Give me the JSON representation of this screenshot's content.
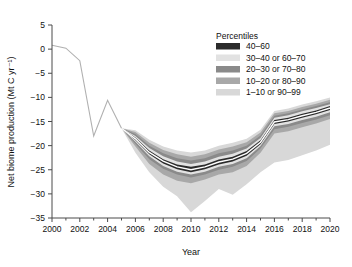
{
  "chart_data": {
    "type": "area",
    "title": "",
    "xlabel": "Year",
    "ylabel": "Net biome production (Mt C yr⁻¹)",
    "xlim": [
      2000,
      2020
    ],
    "ylim": [
      -35,
      5
    ],
    "xticks": [
      2000,
      2002,
      2004,
      2006,
      2008,
      2010,
      2012,
      2014,
      2016,
      2018,
      2020
    ],
    "xtick_labels": [
      "2000",
      "2002",
      "2004",
      "2006",
      "2008",
      "2010",
      "2012",
      "2014",
      "2016",
      "2018",
      "2020"
    ],
    "xminor_ticks": [
      2001,
      2003,
      2005,
      2007,
      2009,
      2011,
      2013,
      2015,
      2017,
      2019
    ],
    "yticks": [
      5,
      0,
      -5,
      -10,
      -15,
      -20,
      -25,
      -30,
      -35
    ],
    "ytick_labels": [
      "5",
      "0",
      "−5",
      "−10",
      "−15",
      "−20",
      "−25",
      "−30",
      "−35"
    ],
    "grid": false,
    "legend_position": "top-right",
    "legend_title": "Percentiles",
    "legend_entries": [
      {
        "label": "40–60",
        "color": "#2b2b2b"
      },
      {
        "label": "30–40 or 60–70",
        "color": "#e2e2e2"
      },
      {
        "label": "20–30 or 70–80",
        "color": "#8a8a8a"
      },
      {
        "label": "10–20 or 80–90",
        "color": "#a8a8a8"
      },
      {
        "label": "1–10 or 90–99",
        "color": "#d8d8d8"
      }
    ],
    "x": [
      2000,
      2001,
      2002,
      2003,
      2004,
      2005,
      2006,
      2007,
      2008,
      2009,
      2010,
      2011,
      2012,
      2013,
      2014,
      2015,
      2016,
      2017,
      2018,
      2019,
      2020
    ],
    "series": [
      {
        "name": "historical_line",
        "values": [
          0.8,
          0.2,
          -2.4,
          -18.0,
          -10.6,
          -16.4,
          null,
          null,
          null,
          null,
          null,
          null,
          null,
          null,
          null,
          null,
          null,
          null,
          null,
          null,
          null
        ]
      },
      {
        "name": "p1",
        "values": [
          null,
          null,
          null,
          null,
          null,
          -16.4,
          -21.5,
          -25.5,
          -28.5,
          -30.5,
          -33.8,
          -31.5,
          -29.0,
          -30.2,
          -28.0,
          -25.5,
          -23.5,
          -23.0,
          -22.0,
          -21.0,
          -19.8
        ]
      },
      {
        "name": "p10",
        "values": [
          null,
          null,
          null,
          null,
          null,
          -16.4,
          -20.2,
          -23.8,
          -26.0,
          -27.3,
          -27.8,
          -27.0,
          -26.0,
          -25.5,
          -24.2,
          -21.5,
          -17.5,
          -17.0,
          -16.2,
          -15.4,
          -14.5
        ]
      },
      {
        "name": "p20",
        "values": [
          null,
          null,
          null,
          null,
          null,
          -16.4,
          -19.6,
          -22.8,
          -24.8,
          -26.0,
          -26.6,
          -26.0,
          -25.0,
          -24.4,
          -23.2,
          -20.6,
          -16.6,
          -16.1,
          -15.3,
          -14.6,
          -13.7
        ]
      },
      {
        "name": "p30",
        "values": [
          null,
          null,
          null,
          null,
          null,
          -16.4,
          -19.2,
          -22.2,
          -24.2,
          -25.4,
          -26.0,
          -25.4,
          -24.4,
          -23.8,
          -22.6,
          -20.1,
          -16.0,
          -15.5,
          -14.7,
          -14.0,
          -13.1
        ]
      },
      {
        "name": "p40",
        "values": [
          null,
          null,
          null,
          null,
          null,
          -16.4,
          -18.9,
          -21.8,
          -23.7,
          -24.9,
          -25.5,
          -24.9,
          -23.9,
          -23.3,
          -22.1,
          -19.7,
          -15.5,
          -15.0,
          -14.2,
          -13.5,
          -12.6
        ]
      },
      {
        "name": "p50",
        "values": [
          null,
          null,
          null,
          null,
          null,
          -16.4,
          -18.6,
          -21.4,
          -23.2,
          -24.4,
          -25.0,
          -24.4,
          -23.4,
          -22.8,
          -21.6,
          -19.3,
          -15.1,
          -14.6,
          -13.8,
          -13.1,
          -12.2
        ]
      },
      {
        "name": "p60",
        "values": [
          null,
          null,
          null,
          null,
          null,
          -16.4,
          -18.3,
          -21.0,
          -22.8,
          -23.9,
          -24.4,
          -23.9,
          -22.9,
          -22.3,
          -21.1,
          -18.9,
          -14.7,
          -14.2,
          -13.4,
          -12.7,
          -11.8
        ]
      },
      {
        "name": "p70",
        "values": [
          null,
          null,
          null,
          null,
          null,
          -16.4,
          -18.0,
          -20.5,
          -22.2,
          -23.3,
          -23.8,
          -23.3,
          -22.3,
          -21.7,
          -20.6,
          -18.4,
          -14.2,
          -13.7,
          -12.9,
          -12.2,
          -11.4
        ]
      },
      {
        "name": "p80",
        "values": [
          null,
          null,
          null,
          null,
          null,
          -16.4,
          -17.6,
          -20.0,
          -21.6,
          -22.6,
          -23.1,
          -22.6,
          -21.6,
          -21.0,
          -20.0,
          -17.9,
          -13.8,
          -13.3,
          -12.5,
          -11.8,
          -11.0
        ]
      },
      {
        "name": "p90",
        "values": [
          null,
          null,
          null,
          null,
          null,
          -16.4,
          -17.2,
          -19.4,
          -20.9,
          -21.8,
          -22.3,
          -21.8,
          -20.8,
          -20.2,
          -19.3,
          -17.3,
          -13.3,
          -12.8,
          -12.0,
          -11.3,
          -10.5
        ]
      },
      {
        "name": "p99",
        "values": [
          null,
          null,
          null,
          null,
          null,
          -16.4,
          -16.8,
          -18.8,
          -20.2,
          -21.0,
          -21.4,
          -21.0,
          -20.0,
          -19.4,
          -18.6,
          -16.7,
          -12.8,
          -12.3,
          -11.5,
          -10.8,
          -10.0
        ]
      }
    ],
    "bands": [
      {
        "name": "1–10 or 90–99",
        "lower": "p1",
        "upper": "p99",
        "color": "#d8d8d8"
      },
      {
        "name": "10–20 or 80–90",
        "lower": "p10",
        "upper": "p90",
        "color": "#a8a8a8"
      },
      {
        "name": "20–30 or 70–80",
        "lower": "p20",
        "upper": "p80",
        "color": "#8a8a8a"
      },
      {
        "name": "30–40 or 60–70",
        "lower": "p30",
        "upper": "p70",
        "color": "#e2e2e2"
      },
      {
        "name": "40–60",
        "lower": "p40",
        "upper": "p60",
        "color": "#2b2b2b"
      }
    ],
    "median_line": "p50",
    "median_line_color": "#ffffff",
    "historical_line_color": "#b0b0b0"
  }
}
